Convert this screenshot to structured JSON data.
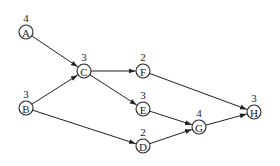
{
  "diagram": {
    "type": "directed-graph",
    "colors": {
      "stroke": "#222222",
      "background": "#ffffff"
    },
    "nodes": [
      {
        "id": "A",
        "label": "A",
        "weight": "4",
        "x": 26,
        "y": 32
      },
      {
        "id": "B",
        "label": "B",
        "weight": "3",
        "x": 26,
        "y": 108
      },
      {
        "id": "C",
        "label": "C",
        "weight": "3",
        "x": 84,
        "y": 71
      },
      {
        "id": "F",
        "label": "F",
        "weight": "2",
        "x": 143,
        "y": 71
      },
      {
        "id": "E",
        "label": "E",
        "weight": "3",
        "x": 143,
        "y": 109
      },
      {
        "id": "D",
        "label": "D",
        "weight": "2",
        "x": 143,
        "y": 146
      },
      {
        "id": "G",
        "label": "G",
        "weight": "4",
        "x": 199,
        "y": 127
      },
      {
        "id": "H",
        "label": "H",
        "weight": "3",
        "x": 254,
        "y": 112
      }
    ],
    "edges": [
      {
        "from": "A",
        "to": "C"
      },
      {
        "from": "B",
        "to": "C"
      },
      {
        "from": "B",
        "to": "D"
      },
      {
        "from": "C",
        "to": "F"
      },
      {
        "from": "C",
        "to": "E"
      },
      {
        "from": "F",
        "to": "H"
      },
      {
        "from": "E",
        "to": "G"
      },
      {
        "from": "D",
        "to": "G"
      },
      {
        "from": "G",
        "to": "H"
      }
    ]
  }
}
